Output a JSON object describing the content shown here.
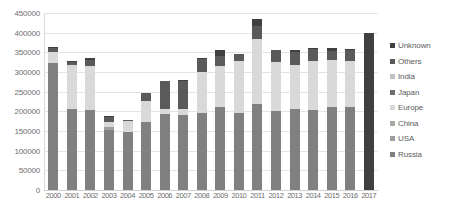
{
  "chart_data": {
    "type": "bar",
    "stacked": true,
    "title": "",
    "subtitle": "",
    "xlabel": "",
    "ylabel": "",
    "ylim": [
      0,
      450000
    ],
    "ytick_values": [
      0,
      50000,
      100000,
      150000,
      200000,
      250000,
      300000,
      350000,
      400000,
      450000
    ],
    "ytick_labels": [
      "0",
      "50000",
      "100000",
      "150000",
      "200000",
      "250000",
      "300000",
      "350000",
      "400000",
      "450000"
    ],
    "grid": true,
    "legend_position": "right",
    "categories": [
      "2000",
      "2001",
      "2002",
      "2003",
      "2004",
      "2005",
      "2006",
      "2007",
      "2008",
      "2009",
      "2010",
      "2011",
      "2012",
      "2013",
      "2014",
      "2015",
      "2016",
      "2017"
    ],
    "series": [
      {
        "name": "Russia",
        "color": "#808080",
        "values": [
          322000,
          205000,
          204000,
          152000,
          148000,
          172000,
          194000,
          190000,
          196000,
          211000,
          197000,
          219000,
          200000,
          205000,
          203000,
          210000,
          212000,
          0
        ]
      },
      {
        "name": "USA",
        "color": "#9e9e9e",
        "values": [
          0,
          0,
          0,
          8000,
          0,
          0,
          0,
          0,
          0,
          0,
          0,
          0,
          0,
          0,
          0,
          0,
          0,
          0
        ]
      },
      {
        "name": "China",
        "color": "#a8a8a8",
        "values": [
          0,
          0,
          0,
          0,
          0,
          0,
          0,
          0,
          0,
          0,
          0,
          0,
          0,
          0,
          0,
          0,
          0,
          0
        ]
      },
      {
        "name": "Europe",
        "color": "#d9d9d9",
        "values": [
          28000,
          112000,
          112000,
          12000,
          28000,
          55000,
          12000,
          15000,
          104000,
          105000,
          130000,
          165000,
          126000,
          113000,
          125000,
          120000,
          115000,
          0
        ]
      },
      {
        "name": "Japan",
        "color": "#6e6e6e",
        "values": [
          0,
          0,
          0,
          0,
          0,
          0,
          0,
          0,
          0,
          0,
          0,
          0,
          0,
          0,
          0,
          0,
          0,
          0
        ]
      },
      {
        "name": "India",
        "color": "#c2c2c2",
        "values": [
          0,
          0,
          0,
          0,
          0,
          0,
          0,
          0,
          0,
          0,
          0,
          0,
          0,
          0,
          0,
          0,
          0,
          0
        ]
      },
      {
        "name": "Others",
        "color": "#5a5a5a",
        "values": [
          10000,
          9000,
          15000,
          14000,
          3000,
          20000,
          70000,
          72000,
          32000,
          24000,
          20000,
          34000,
          30000,
          32000,
          30000,
          24000,
          28000,
          0
        ]
      },
      {
        "name": "Unknown",
        "color": "#404040",
        "values": [
          4000,
          3000,
          4000,
          3000,
          0,
          0,
          0,
          4000,
          4000,
          15000,
          0,
          18000,
          0,
          5000,
          3000,
          7000,
          4000,
          398000
        ]
      }
    ],
    "totals": [
      364000,
      329000,
      335000,
      189000,
      179000,
      247000,
      276000,
      281000,
      336000,
      355000,
      347000,
      436000,
      356000,
      355000,
      361000,
      361000,
      359000,
      398000
    ]
  },
  "legend": {
    "items": [
      {
        "label": "Unknown",
        "color": "#404040"
      },
      {
        "label": "Others",
        "color": "#5a5a5a"
      },
      {
        "label": "India",
        "color": "#c2c2c2"
      },
      {
        "label": "Japan",
        "color": "#6e6e6e"
      },
      {
        "label": "Europe",
        "color": "#d9d9d9"
      },
      {
        "label": "China",
        "color": "#a8a8a8"
      },
      {
        "label": "USA",
        "color": "#9e9e9e"
      },
      {
        "label": "Russia",
        "color": "#808080"
      }
    ]
  }
}
